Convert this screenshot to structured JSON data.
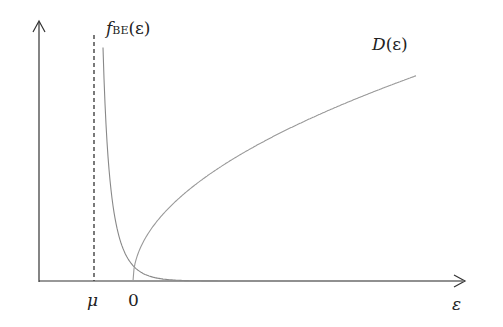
{
  "diagram": {
    "labels": {
      "f_main": "f",
      "f_sub": "BE",
      "f_arg": "(ε)",
      "d_main": "D",
      "d_arg": "(ε)",
      "mu": "μ",
      "zero": "0",
      "x_axis": "ε"
    },
    "colors": {
      "axis": "#333333",
      "curve": "#888888",
      "dashed": "#333333"
    }
  },
  "chart_data": {
    "type": "line",
    "title": "",
    "xlabel": "ε",
    "ylabel": "",
    "x_ticks": [
      "μ",
      "0"
    ],
    "series": [
      {
        "name": "f_BE(ε)",
        "form": "1/(exp((ε-μ)/T)-1)",
        "asymptote": "ε = μ (dashed)"
      },
      {
        "name": "D(ε)",
        "form": "∝ sqrt(ε), ε ≥ 0"
      }
    ],
    "grid": false,
    "legend": "inline labels"
  }
}
